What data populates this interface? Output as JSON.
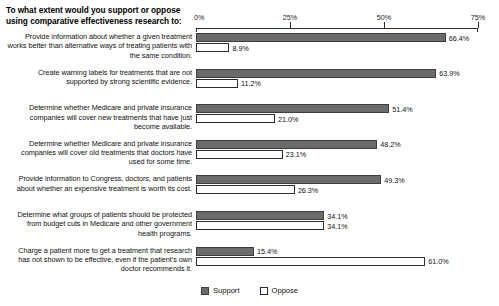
{
  "chart_data": {
    "type": "bar",
    "orientation": "horizontal",
    "title": "To what extent would you support or oppose using comparative effectiveness research to:",
    "xlabel": "",
    "ylabel": "",
    "xlim": [
      0,
      75
    ],
    "xticks": [
      0,
      25,
      50,
      75
    ],
    "xtick_labels": [
      "0%",
      "25%",
      "50%",
      "75%"
    ],
    "grid": false,
    "legend_position": "bottom-center",
    "value_label_suffix": "%",
    "categories": [
      "Provide information about whether a given treatment works better than alternative ways of treating patients with the same condition.",
      "Create warning labels for treatments that are not supported by strong scientific evidence.",
      "Determine whether Medicare and private insurance companies will cover new treatments that have just become available.",
      "Determine whether Medicare and private insurance companies will cover old treatments that doctors have used for some time.",
      "Provide information to Congress, doctors, and patients about whether an expensive treatment is worth its cost.",
      "Determine what groups of patients should be protected from budget cuts in Medicare and other government health programs.",
      "Charge a patient more to get a treatment that research has not shown to be effective, even if the patient's own doctor recommends it."
    ],
    "series": [
      {
        "name": "Support",
        "color": "#6b6b6b",
        "values": [
          66.4,
          63.9,
          51.4,
          48.2,
          49.3,
          34.1,
          15.4
        ],
        "labels": [
          "66.4%",
          "63.9%",
          "51.4%",
          "48.2%",
          "49.3%",
          "34.1%",
          "15.4%"
        ]
      },
      {
        "name": "Oppose",
        "color": "#ffffff",
        "values": [
          8.9,
          11.2,
          21.0,
          23.1,
          26.3,
          34.1,
          61.0
        ],
        "labels": [
          "8.9%",
          "11.2%",
          "21.0%",
          "23.1%",
          "26.3%",
          "34.1%",
          "61.0%"
        ]
      }
    ]
  },
  "legend": {
    "items": [
      {
        "label": "Support",
        "swatch": "filled-gray-swatch"
      },
      {
        "label": "Oppose",
        "swatch": "outlined-white-swatch"
      }
    ]
  }
}
